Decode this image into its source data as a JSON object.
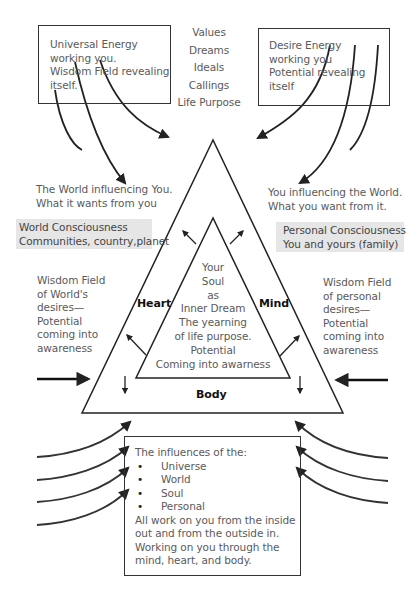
{
  "diagram": {
    "top_left_box": {
      "lines": [
        "Universal Energy",
        "working you.",
        "Wisdom Field revealing",
        "itself."
      ]
    },
    "top_center_list": {
      "items": [
        "Values",
        "Dreams",
        "Ideals",
        "Callings",
        "Life Purpose"
      ]
    },
    "top_right_box": {
      "lines": [
        "Desire Energy",
        "working you",
        "Potential revealing",
        "itself"
      ]
    },
    "left_influence": {
      "lines": [
        "The World influencing You.",
        "What it wants from you"
      ]
    },
    "right_influence": {
      "lines": [
        "You influencing the World.",
        "What you want from it."
      ]
    },
    "left_consciousness": {
      "lines": [
        "World Consciousness",
        "Communities, country,planet"
      ]
    },
    "right_consciousness": {
      "lines": [
        "Personal Consciousness",
        "You and yours (family)"
      ]
    },
    "left_wisdom": {
      "lines": [
        "Wisdom Field",
        "of World's",
        "desires—",
        "Potential",
        "coming into",
        "awareness"
      ]
    },
    "right_wisdom": {
      "lines": [
        "Wisdom Field",
        "of personal",
        "desires—",
        "Potential",
        "coming into",
        "awareness"
      ]
    },
    "triangle": {
      "left_side_label": "Heart",
      "right_side_label": "Mind",
      "base_label": "Body",
      "inner_lines": [
        "Your",
        "Soul",
        "as",
        "Inner Dream",
        "The yearning",
        "of life purpose.",
        "Potential",
        "Coming into awarness"
      ]
    },
    "bottom_box": {
      "intro": "The influences of the:",
      "bullets": [
        "Universe",
        "World",
        "Soul",
        "Personal"
      ],
      "closing_lines": [
        "All work on you from the inside",
        "out and from the outside in.",
        "Working on you through the",
        "mind, heart, and body."
      ]
    },
    "colors": {
      "line": "#222222",
      "text": "#5a5a5a",
      "shade": "#e6e6e6",
      "background": "#ffffff"
    }
  }
}
